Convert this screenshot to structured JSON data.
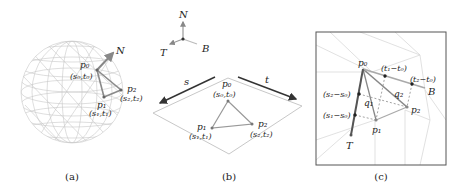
{
  "panels": [
    {
      "id": "a",
      "caption": "(a)",
      "labels": {
        "N": "N",
        "p0": "p₀",
        "p0_coord": "(s₀,t₀)",
        "p1": "p₁",
        "p1_coord": "(s₁,t₁)",
        "p2": "p₂",
        "p2_coord": "(s₂,t₂)"
      }
    },
    {
      "id": "b",
      "caption": "(b)",
      "labels": {
        "N": "N",
        "T": "T",
        "B": "B",
        "s": "s",
        "t": "t",
        "p0": "p₀",
        "p0_coord": "(s₀,t₀)",
        "p1": "p₁",
        "p1_coord": "(s₁,t₁)",
        "p2": "p₂",
        "p2_coord": "(s₂,t₂)"
      }
    },
    {
      "id": "c",
      "caption": "(c)",
      "labels": {
        "p0": "p₀",
        "p1": "p₁",
        "p2": "p₂",
        "q1": "q₁",
        "q2": "q₂",
        "T": "T",
        "B": "B",
        "t1_t0": "(t₁−t₀)",
        "t2_t0": "(t₂−t₀)",
        "s2_s0": "(s₂−s₀)",
        "s1_s0": "(s₁−s₀)"
      }
    }
  ],
  "colors": {
    "mesh": "#c8c8c8",
    "edge": "#8a8a8a",
    "arrow_dark": "#333333",
    "vertex": "#666666",
    "frame": "#555555"
  }
}
